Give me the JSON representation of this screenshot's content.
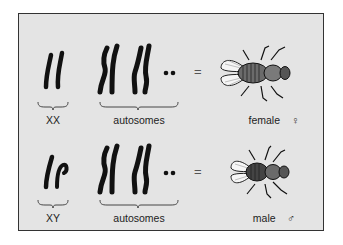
{
  "figure": {
    "rows": [
      {
        "sex_chromosomes_label": "XX",
        "autosomes_label": "autosomes",
        "equals": "=",
        "result_label": "female",
        "symbol": "♀"
      },
      {
        "sex_chromosomes_label": "XY",
        "autosomes_label": "autosomes",
        "equals": "=",
        "result_label": "male",
        "symbol": "♂"
      }
    ]
  },
  "colors": {
    "panel_background": "#e4e4e4",
    "border": "#333333",
    "chromosome": "#111111"
  }
}
